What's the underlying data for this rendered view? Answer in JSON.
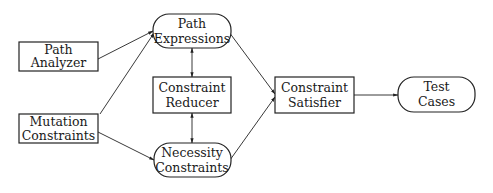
{
  "diagram": {
    "type": "flowchart",
    "nodes": {
      "path_analyzer": {
        "shape": "rectangle",
        "line1": "Path",
        "line2": "Analyzer"
      },
      "mutation_constraints": {
        "shape": "rectangle",
        "line1": "Mutation",
        "line2": "Constraints"
      },
      "path_expressions": {
        "shape": "rounded",
        "line1": "Path",
        "line2": "Expressions"
      },
      "constraint_reducer": {
        "shape": "rectangle",
        "line1": "Constraint",
        "line2": "Reducer"
      },
      "necessity_constraints": {
        "shape": "rounded",
        "line1": "Necessity",
        "line2": "Constraints"
      },
      "constraint_satisfier": {
        "shape": "rectangle",
        "line1": "Constraint",
        "line2": "Satisfier"
      },
      "test_cases": {
        "shape": "rounded",
        "line1": "Test",
        "line2": "Cases"
      }
    },
    "edges": [
      {
        "from": "Path Analyzer",
        "to": "Path Expressions",
        "direction": "forward"
      },
      {
        "from": "Mutation Constraints",
        "to": "Path Expressions",
        "direction": "forward"
      },
      {
        "from": "Mutation Constraints",
        "to": "Necessity Constraints",
        "direction": "forward"
      },
      {
        "from": "Path Expressions",
        "to": "Constraint Reducer",
        "direction": "bidirectional"
      },
      {
        "from": "Constraint Reducer",
        "to": "Necessity Constraints",
        "direction": "bidirectional"
      },
      {
        "from": "Path Expressions",
        "to": "Constraint Satisfier",
        "direction": "forward"
      },
      {
        "from": "Necessity Constraints",
        "to": "Constraint Satisfier",
        "direction": "forward"
      },
      {
        "from": "Constraint Satisfier",
        "to": "Test Cases",
        "direction": "forward"
      }
    ]
  }
}
